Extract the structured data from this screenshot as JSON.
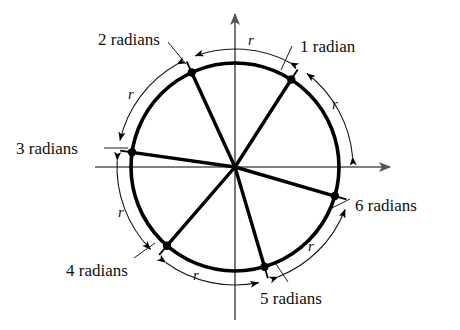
{
  "figure": {
    "kind": "unit-circle-radian-diagram",
    "stroke_color": "#000000",
    "axis_color": "#555555",
    "background": "#ffffff",
    "center": {
      "x": 235,
      "y": 167
    },
    "radius": 104,
    "arc_radius": 118
  },
  "axes": {
    "x_axis": {
      "x1": 95,
      "y1": 167,
      "x2": 390,
      "y2": 167,
      "arrow": "right"
    },
    "y_axis": {
      "x1": 235,
      "y1": 320,
      "x2": 235,
      "y2": 14,
      "arrow": "up"
    }
  },
  "radian_labels": [
    {
      "id": "1-radian",
      "text": "1 radian",
      "angle_radians": 1,
      "x": 300,
      "y": 38
    },
    {
      "id": "2-radians",
      "text": "2 radians",
      "angle_radians": 2,
      "x": 98,
      "y": 31
    },
    {
      "id": "3-radians",
      "text": "3 radians",
      "angle_radians": 3,
      "x": 16,
      "y": 140
    },
    {
      "id": "4-radians",
      "text": "4 radians",
      "angle_radians": 4,
      "x": 66,
      "y": 262
    },
    {
      "id": "5-radians",
      "text": "5 radians",
      "angle_radians": 5,
      "x": 260,
      "y": 290
    },
    {
      "id": "6-radians",
      "text": "6 radians",
      "angle_radians": 6,
      "x": 355,
      "y": 197
    }
  ],
  "arc_labels": [
    {
      "id": "r-arc-0-1",
      "text": "r",
      "x": 248,
      "y": 33
    },
    {
      "id": "r-arc-1-2",
      "text": "r",
      "x": 128,
      "y": 87
    },
    {
      "id": "r-arc-2-3",
      "text": "r",
      "x": 332,
      "y": 97
    },
    {
      "id": "r-arc-3-4",
      "text": "r",
      "x": 118,
      "y": 205
    },
    {
      "id": "r-arc-4-5",
      "text": "r",
      "x": 193,
      "y": 268
    },
    {
      "id": "r-arc-5-6",
      "text": "r",
      "x": 308,
      "y": 239
    }
  ]
}
